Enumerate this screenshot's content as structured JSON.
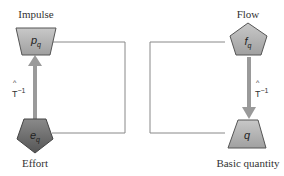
{
  "diagram": {
    "nodes": {
      "impulse": {
        "label": "Impulse",
        "symbol": "p",
        "subscript": "q",
        "shape": "trapezoid-inverted"
      },
      "effort": {
        "label": "Effort",
        "symbol": "e",
        "subscript": "q",
        "shape": "pentagon-inverted"
      },
      "flow": {
        "label": "Flow",
        "symbol": "f",
        "subscript": "q",
        "shape": "pentagon"
      },
      "basic": {
        "label": "Basic quantity",
        "symbol": "q",
        "subscript": "",
        "shape": "trapezoid"
      }
    },
    "operators": {
      "left": {
        "hat": "^",
        "base": "T",
        "exp": "−1"
      },
      "right": {
        "hat": "^",
        "base": "T",
        "exp": "−1"
      }
    },
    "colors": {
      "light_fill": "#b4b4b4",
      "dark_fill": "#6e6e6e",
      "arrow": "#9a9a9a",
      "line": "#777777"
    }
  }
}
